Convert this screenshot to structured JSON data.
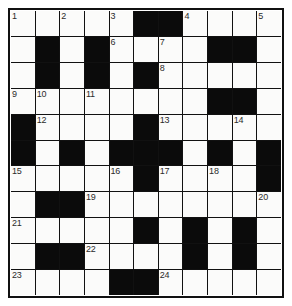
{
  "puzzle": {
    "title": "Crossword Grid",
    "rows": 11,
    "cols": 11,
    "colors": {
      "block": "#0b0b0b",
      "open": "#fbfbfa",
      "grid_line": "#111111",
      "number_text": "#2b2b2b",
      "page_background": "#ffffff"
    },
    "grid": [
      [
        "open",
        "open",
        "open",
        "open",
        "open",
        "block",
        "block",
        "open",
        "open",
        "open",
        "open"
      ],
      [
        "open",
        "block",
        "open",
        "block",
        "open",
        "open",
        "open",
        "open",
        "block",
        "block",
        "open"
      ],
      [
        "open",
        "block",
        "open",
        "block",
        "open",
        "block",
        "open",
        "open",
        "open",
        "open",
        "open"
      ],
      [
        "open",
        "open",
        "open",
        "open",
        "open",
        "open",
        "open",
        "open",
        "block",
        "block",
        "open"
      ],
      [
        "block",
        "open",
        "open",
        "open",
        "open",
        "block",
        "open",
        "open",
        "open",
        "open",
        "open"
      ],
      [
        "block",
        "open",
        "block",
        "open",
        "block",
        "block",
        "block",
        "open",
        "block",
        "open",
        "block"
      ],
      [
        "open",
        "open",
        "open",
        "open",
        "open",
        "block",
        "open",
        "open",
        "open",
        "open",
        "block"
      ],
      [
        "open",
        "block",
        "block",
        "open",
        "open",
        "open",
        "open",
        "open",
        "open",
        "open",
        "open"
      ],
      [
        "open",
        "open",
        "open",
        "open",
        "open",
        "block",
        "open",
        "block",
        "open",
        "block",
        "open"
      ],
      [
        "open",
        "block",
        "block",
        "open",
        "open",
        "open",
        "open",
        "block",
        "open",
        "block",
        "open"
      ],
      [
        "open",
        "open",
        "open",
        "open",
        "block",
        "block",
        "open",
        "open",
        "open",
        "open",
        "open"
      ]
    ],
    "numbers": [
      {
        "row": 0,
        "col": 0,
        "label": "1"
      },
      {
        "row": 0,
        "col": 2,
        "label": "2"
      },
      {
        "row": 0,
        "col": 4,
        "label": "3"
      },
      {
        "row": 0,
        "col": 7,
        "label": "4"
      },
      {
        "row": 0,
        "col": 10,
        "label": "5"
      },
      {
        "row": 1,
        "col": 4,
        "label": "6"
      },
      {
        "row": 1,
        "col": 6,
        "label": "7"
      },
      {
        "row": 2,
        "col": 6,
        "label": "8"
      },
      {
        "row": 3,
        "col": 0,
        "label": "9"
      },
      {
        "row": 3,
        "col": 1,
        "label": "10"
      },
      {
        "row": 3,
        "col": 3,
        "label": "11"
      },
      {
        "row": 4,
        "col": 1,
        "label": "12"
      },
      {
        "row": 4,
        "col": 6,
        "label": "13"
      },
      {
        "row": 4,
        "col": 9,
        "label": "14"
      },
      {
        "row": 6,
        "col": 0,
        "label": "15"
      },
      {
        "row": 6,
        "col": 4,
        "label": "16"
      },
      {
        "row": 6,
        "col": 6,
        "label": "17"
      },
      {
        "row": 6,
        "col": 8,
        "label": "18"
      },
      {
        "row": 7,
        "col": 3,
        "label": "19"
      },
      {
        "row": 7,
        "col": 10,
        "label": "20"
      },
      {
        "row": 8,
        "col": 0,
        "label": "21"
      },
      {
        "row": 9,
        "col": 3,
        "label": "22"
      },
      {
        "row": 10,
        "col": 0,
        "label": "23"
      },
      {
        "row": 10,
        "col": 6,
        "label": "24"
      }
    ],
    "entries": []
  }
}
